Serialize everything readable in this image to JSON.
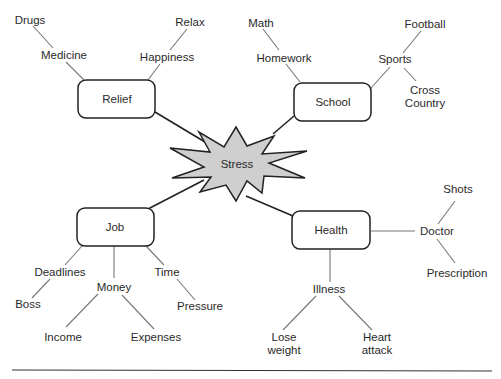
{
  "diagram": {
    "type": "mind-map",
    "center": {
      "label": "Stress",
      "shape": "starburst",
      "fill": "#cfcfcf",
      "stroke": "#222222"
    },
    "branches": [
      {
        "label": "Relief",
        "children": [
          {
            "label": "Medicine",
            "children": [
              {
                "label": "Drugs"
              }
            ]
          },
          {
            "label": "Happiness",
            "children": [
              {
                "label": "Relax"
              }
            ]
          }
        ]
      },
      {
        "label": "School",
        "children": [
          {
            "label": "Homework",
            "children": [
              {
                "label": "Math"
              }
            ]
          },
          {
            "label": "Sports",
            "children": [
              {
                "label": "Football"
              },
              {
                "label_line1": "Cross",
                "label_line2": "Country"
              }
            ]
          }
        ]
      },
      {
        "label": "Job",
        "children": [
          {
            "label": "Deadlines",
            "children": [
              {
                "label": "Boss"
              }
            ]
          },
          {
            "label": "Money",
            "children": [
              {
                "label": "Income"
              },
              {
                "label": "Expenses"
              }
            ]
          },
          {
            "label": "Time",
            "children": [
              {
                "label": "Pressure"
              }
            ]
          }
        ]
      },
      {
        "label": "Health",
        "children": [
          {
            "label": "Doctor",
            "children": [
              {
                "label": "Shots"
              },
              {
                "label": "Prescription"
              }
            ]
          },
          {
            "label": "Illness",
            "children": [
              {
                "label_line1": "Lose",
                "label_line2": "weight"
              },
              {
                "label_line1": "Heart",
                "label_line2": "attack"
              }
            ]
          }
        ]
      }
    ]
  }
}
